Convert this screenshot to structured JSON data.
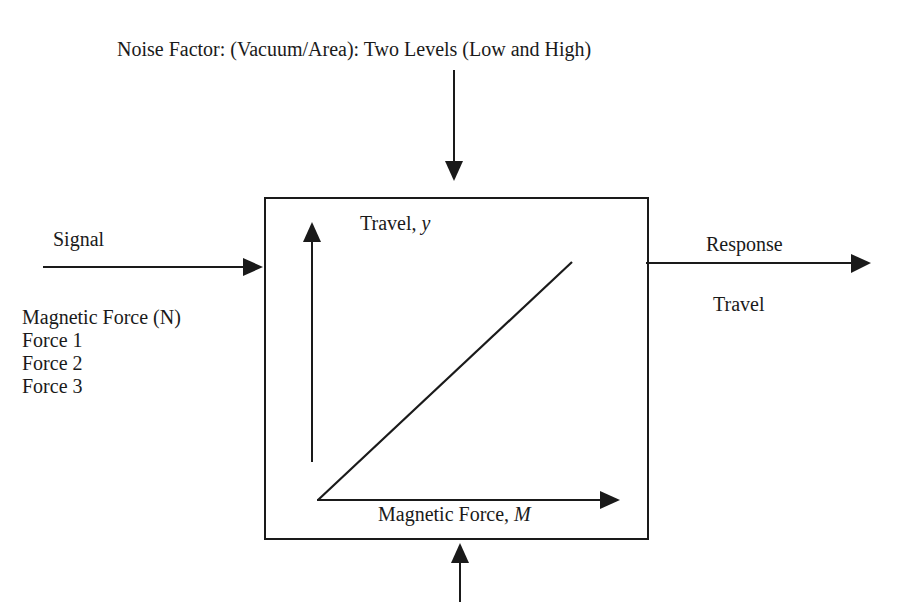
{
  "noise": {
    "label": "Noise Factor: (Vacuum/Area): Two Levels (Low and High)"
  },
  "signal": {
    "label": "Signal",
    "factor_title": "Magnetic Force (N)",
    "levels": [
      "Force 1",
      "Force 2",
      "Force 3"
    ]
  },
  "response": {
    "label": "Response",
    "value": "Travel"
  },
  "system": {
    "y_axis_label": "Travel, ",
    "y_axis_var": "y",
    "x_axis_label": "Magnetic Force, ",
    "x_axis_var": "M"
  },
  "colors": {
    "line": "#1a1a1a",
    "background": "#ffffff"
  }
}
